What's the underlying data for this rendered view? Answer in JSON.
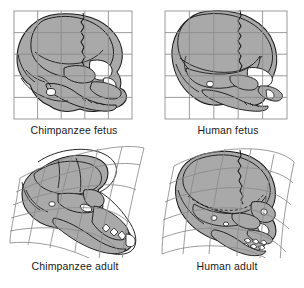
{
  "figure": {
    "background_color": "#ffffff",
    "bone_fill_color": "#a9a9a9",
    "bone_outline_color": "#1a1a1a",
    "grid_line_color": "#8a8a8a",
    "caption_color": "#1a1a1a"
  },
  "panels": [
    {
      "id": "chimpanzee-fetus",
      "caption": "Chimpanzee fetus",
      "row": "top",
      "column": "left",
      "grid_type": "cartesian",
      "grid_columns": 5,
      "grid_rows": 5,
      "view": "lateral",
      "stage": "fetus",
      "species": "Chimpanzee"
    },
    {
      "id": "human-fetus",
      "caption": "Human fetus",
      "row": "top",
      "column": "right",
      "grid_type": "cartesian",
      "grid_columns": 5,
      "grid_rows": 5,
      "view": "lateral",
      "stage": "fetus",
      "species": "Human"
    },
    {
      "id": "chimpanzee-adult",
      "caption": "Chimpanzee adult",
      "row": "bottom",
      "column": "left",
      "grid_type": "deformed",
      "grid_columns": 5,
      "grid_rows": 5,
      "view": "lateral",
      "stage": "adult",
      "species": "Chimpanzee"
    },
    {
      "id": "human-adult",
      "caption": "Human adult",
      "row": "bottom",
      "column": "right",
      "grid_type": "deformed",
      "grid_columns": 5,
      "grid_rows": 5,
      "view": "lateral",
      "stage": "adult",
      "species": "Human"
    }
  ]
}
